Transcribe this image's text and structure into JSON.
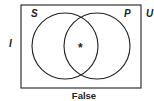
{
  "diagram": {
    "type": "venn",
    "universe_label": "U",
    "outside_label": "I",
    "sets": [
      {
        "label": "S"
      },
      {
        "label": "P"
      }
    ],
    "intersection_mark": "*",
    "caption": "False"
  },
  "colors": {
    "stroke": "#222222",
    "background": "#ffffff"
  }
}
